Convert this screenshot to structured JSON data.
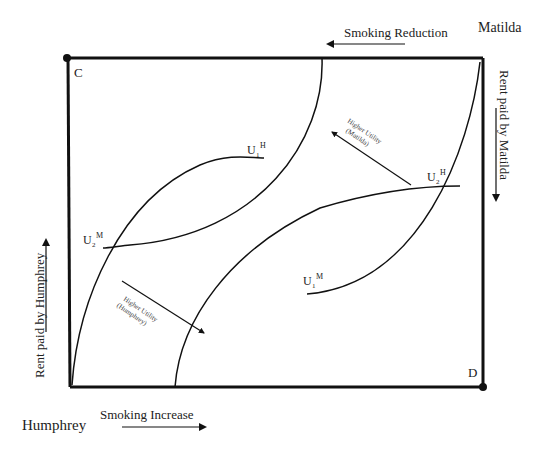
{
  "diagram": {
    "type": "edgeworth-box",
    "corners": {
      "top_left": "C",
      "bottom_right": "D"
    },
    "agents": {
      "top_right": "Matilda",
      "bottom_left": "Humphrey"
    },
    "axes": {
      "top": "Smoking Reduction",
      "bottom": "Smoking Increase",
      "left": "Rent paid by Humphrey",
      "right": "Rent paid by Matilda"
    },
    "curves": {
      "u1h": {
        "base": "U",
        "sub": "1",
        "sup": "H"
      },
      "u2h": {
        "base": "U",
        "sub": "2",
        "sup": "H"
      },
      "u1m": {
        "base": "U",
        "sub": "1",
        "sup": "M"
      },
      "u2m": {
        "base": "U",
        "sub": "2",
        "sup": "M"
      }
    },
    "annotations": {
      "matilda_line1": "Higher Utility",
      "matilda_line2": "(Matilda)",
      "humphrey_line1": "Higher Utility",
      "humphrey_line2": "(Humphrey)"
    },
    "colors": {
      "line": "#111111",
      "text": "#222222"
    }
  }
}
